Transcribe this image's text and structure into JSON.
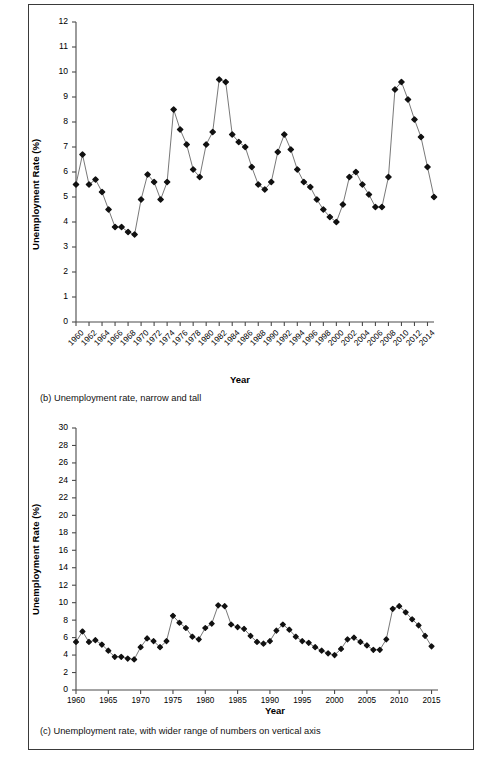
{
  "page": {
    "background": "#ffffff",
    "frame_color": "#3a3a3a"
  },
  "figures": [
    {
      "id": "fig-b",
      "caption": "(b) Unemployment rate, narrow and tall",
      "axis_title_y": "Unemployment Rate (%)",
      "axis_title_x": "Year",
      "chart_data": {
        "type": "line",
        "title": "",
        "subtitle": "",
        "xlabel": "Year",
        "ylabel": "Unemployment Rate (%)",
        "marker": "diamond",
        "marker_color": "#111111",
        "line_color": "#555555",
        "grid": false,
        "legend": false,
        "ylim": [
          0,
          12
        ],
        "ytick_step": 1,
        "yticks": [
          0,
          1,
          2,
          3,
          4,
          5,
          6,
          7,
          8,
          9,
          10,
          11,
          12
        ],
        "xlim": [
          1960,
          2015
        ],
        "xtick_step": 2,
        "xticks": [
          1960,
          1962,
          1964,
          1966,
          1968,
          1970,
          1972,
          1974,
          1976,
          1978,
          1980,
          1982,
          1984,
          1986,
          1988,
          1990,
          1992,
          1994,
          1996,
          1998,
          2000,
          2002,
          2004,
          2006,
          2008,
          2010,
          2012,
          2014
        ],
        "xtick_label_rotation": -45,
        "x": [
          1960,
          1961,
          1962,
          1963,
          1964,
          1965,
          1966,
          1967,
          1968,
          1969,
          1970,
          1971,
          1972,
          1973,
          1974,
          1975,
          1976,
          1977,
          1978,
          1979,
          1980,
          1981,
          1982,
          1983,
          1984,
          1985,
          1986,
          1987,
          1988,
          1989,
          1990,
          1991,
          1992,
          1993,
          1994,
          1995,
          1996,
          1997,
          1998,
          1999,
          2000,
          2001,
          2002,
          2003,
          2004,
          2005,
          2006,
          2007,
          2008,
          2009,
          2010,
          2011,
          2012,
          2013,
          2014,
          2015
        ],
        "values": [
          5.5,
          6.7,
          5.5,
          5.7,
          5.2,
          4.5,
          3.8,
          3.8,
          3.6,
          3.5,
          4.9,
          5.9,
          5.6,
          4.9,
          5.6,
          8.5,
          7.7,
          7.1,
          6.1,
          5.8,
          7.1,
          7.6,
          9.7,
          9.6,
          7.5,
          7.2,
          7.0,
          6.2,
          5.5,
          5.3,
          5.6,
          6.8,
          7.5,
          6.9,
          6.1,
          5.6,
          5.4,
          4.9,
          4.5,
          4.2,
          4.0,
          4.7,
          5.8,
          6.0,
          5.5,
          5.1,
          4.6,
          4.6,
          5.8,
          9.3,
          9.6,
          8.9,
          8.1,
          7.4,
          6.2,
          5.0
        ]
      }
    },
    {
      "id": "fig-c",
      "caption": "(c) Unemployment rate, with wider range of numbers on vertical axis",
      "axis_title_y": "Unemployment Rate (%)",
      "axis_title_x": "Year",
      "chart_data": {
        "type": "line",
        "title": "",
        "subtitle": "",
        "xlabel": "Year",
        "ylabel": "Unemployment Rate (%)",
        "marker": "diamond",
        "marker_color": "#111111",
        "line_color": "#555555",
        "grid": false,
        "legend": false,
        "ylim": [
          0,
          30
        ],
        "ytick_step": 2,
        "yticks": [
          0,
          2,
          4,
          6,
          8,
          10,
          12,
          14,
          16,
          18,
          20,
          22,
          24,
          26,
          28,
          30
        ],
        "xlim": [
          1960,
          2016
        ],
        "xtick_step": 5,
        "xticks": [
          1960,
          1965,
          1970,
          1975,
          1980,
          1985,
          1990,
          1995,
          2000,
          2005,
          2010,
          2015
        ],
        "xtick_label_rotation": 0,
        "x": [
          1960,
          1961,
          1962,
          1963,
          1964,
          1965,
          1966,
          1967,
          1968,
          1969,
          1970,
          1971,
          1972,
          1973,
          1974,
          1975,
          1976,
          1977,
          1978,
          1979,
          1980,
          1981,
          1982,
          1983,
          1984,
          1985,
          1986,
          1987,
          1988,
          1989,
          1990,
          1991,
          1992,
          1993,
          1994,
          1995,
          1996,
          1997,
          1998,
          1999,
          2000,
          2001,
          2002,
          2003,
          2004,
          2005,
          2006,
          2007,
          2008,
          2009,
          2010,
          2011,
          2012,
          2013,
          2014,
          2015
        ],
        "values": [
          5.5,
          6.7,
          5.5,
          5.7,
          5.2,
          4.5,
          3.8,
          3.8,
          3.6,
          3.5,
          4.9,
          5.9,
          5.6,
          4.9,
          5.6,
          8.5,
          7.7,
          7.1,
          6.1,
          5.8,
          7.1,
          7.6,
          9.7,
          9.6,
          7.5,
          7.2,
          7.0,
          6.2,
          5.5,
          5.3,
          5.6,
          6.8,
          7.5,
          6.9,
          6.1,
          5.6,
          5.4,
          4.9,
          4.5,
          4.2,
          4.0,
          4.7,
          5.8,
          6.0,
          5.5,
          5.1,
          4.6,
          4.6,
          5.8,
          9.3,
          9.6,
          8.9,
          8.1,
          7.4,
          6.2,
          5.0
        ]
      }
    }
  ]
}
